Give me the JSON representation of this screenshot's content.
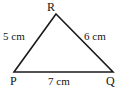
{
  "figure": {
    "kind": "triangle-diagram",
    "background_color": "#ffffff",
    "stroke_color": "#1a1a1a",
    "text_color": "#151515"
  },
  "vertices": {
    "apex": "R",
    "bottom_left": "P",
    "bottom_right": "Q"
  },
  "sides": {
    "left": "5 cm",
    "right": "6 cm",
    "bottom": "7 cm"
  },
  "geometry": {
    "points": {
      "R": {
        "x": 56,
        "y": 14
      },
      "P": {
        "x": 14,
        "y": 72
      },
      "Q": {
        "x": 113,
        "y": 72
      }
    },
    "stroke_width": 1.6
  }
}
